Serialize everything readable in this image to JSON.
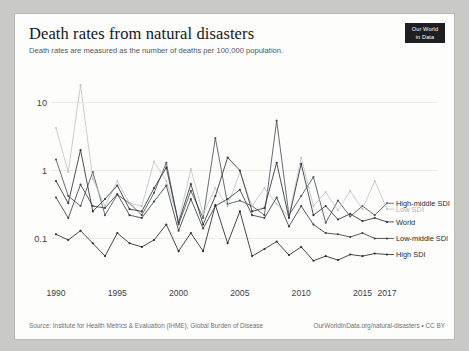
{
  "header": {
    "title": "Death rates from natural disasters",
    "subtitle": "Death rates are measured as the number of deaths per 100,000 population.",
    "logo_line1": "Our World",
    "logo_line2": "in Data"
  },
  "footer": {
    "source": "Source: Institute for Health Metrics & Evaluation (IHME), Global Burden of Disease",
    "link": "OurWorldInData.org/natural-disasters • CC BY"
  },
  "colors": {
    "high_middle_sdi": "#4e5258",
    "low_sdi": "#c2c4c7",
    "world": "#2f3237",
    "low_middle_sdi": "#3a3d42",
    "high_sdi": "#25272b",
    "grid": "#eceae6",
    "background": "#fdfdfc",
    "page": "#c9c9c6"
  },
  "chart_data": {
    "type": "line",
    "title": "Death rates from natural disasters",
    "subtitle": "Death rates are measured as the number of deaths per 100,000 population.",
    "xlabel": "",
    "ylabel": "Deaths per 100,000 population",
    "yscale": "log",
    "ylim": [
      0.03,
      30
    ],
    "yticks": [
      0.1,
      1,
      10
    ],
    "ytick_labels": [
      "0.1",
      "1",
      "10"
    ],
    "xlim": [
      1990,
      2017
    ],
    "xticks": [
      1990,
      1995,
      2000,
      2005,
      2010,
      2015,
      2017
    ],
    "xtick_labels": [
      "1990",
      "1995",
      "2000",
      "2005",
      "2010",
      "2015",
      "2017"
    ],
    "grid": true,
    "legend_position": "right-inline",
    "x": [
      1990,
      1991,
      1992,
      1993,
      1994,
      1995,
      1996,
      1997,
      1998,
      1999,
      2000,
      2001,
      2002,
      2003,
      2004,
      2005,
      2006,
      2007,
      2008,
      2009,
      2010,
      2011,
      2012,
      2013,
      2014,
      2015,
      2016,
      2017
    ],
    "series": [
      {
        "name": "High-middle SDI",
        "color": "#4e5258",
        "label_y_value": 0.33,
        "values": [
          1.45,
          0.42,
          0.3,
          0.95,
          0.22,
          0.44,
          0.33,
          0.22,
          0.47,
          1.3,
          0.16,
          0.5,
          0.2,
          3.0,
          0.32,
          0.36,
          0.3,
          0.22,
          5.4,
          0.22,
          0.42,
          0.8,
          0.17,
          0.36,
          0.21,
          0.3,
          0.22,
          0.33
        ]
      },
      {
        "name": "Low SDI",
        "color": "#c2c4c7",
        "label_y_value": 0.27,
        "values": [
          4.2,
          0.95,
          18.0,
          0.75,
          0.3,
          0.7,
          0.33,
          0.3,
          1.35,
          0.7,
          0.18,
          1.05,
          0.23,
          0.55,
          0.3,
          0.95,
          0.3,
          0.55,
          0.32,
          0.21,
          1.55,
          0.3,
          0.48,
          0.26,
          0.5,
          0.27,
          0.7,
          0.27
        ]
      },
      {
        "name": "World",
        "color": "#2f3237",
        "label_y_value": 0.175,
        "values": [
          0.7,
          0.33,
          2.0,
          0.25,
          0.38,
          0.6,
          0.27,
          0.25,
          0.55,
          1.1,
          0.17,
          0.63,
          0.16,
          0.42,
          1.55,
          1.0,
          0.25,
          0.28,
          1.3,
          0.2,
          1.25,
          0.22,
          0.3,
          0.19,
          0.23,
          0.18,
          0.2,
          0.175
        ]
      },
      {
        "name": "Low-middle SDI",
        "color": "#3a3d42",
        "label_y_value": 0.1,
        "values": [
          0.4,
          0.2,
          0.62,
          0.3,
          0.28,
          0.45,
          0.22,
          0.2,
          0.35,
          0.6,
          0.13,
          0.38,
          0.14,
          0.3,
          0.38,
          0.52,
          0.22,
          0.2,
          0.4,
          0.15,
          0.3,
          0.16,
          0.12,
          0.115,
          0.105,
          0.12,
          0.1,
          0.1
        ]
      },
      {
        "name": "High SDI",
        "color": "#25272b",
        "label_y_value": 0.058,
        "values": [
          0.115,
          0.095,
          0.13,
          0.085,
          0.055,
          0.12,
          0.085,
          0.075,
          0.095,
          0.16,
          0.065,
          0.12,
          0.065,
          0.31,
          0.085,
          0.25,
          0.055,
          0.07,
          0.09,
          0.057,
          0.075,
          0.047,
          0.055,
          0.048,
          0.058,
          0.055,
          0.06,
          0.058
        ]
      }
    ]
  }
}
